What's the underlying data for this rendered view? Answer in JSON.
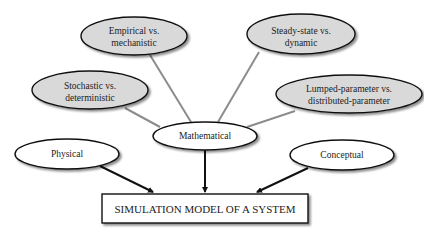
{
  "diagram": {
    "root": {
      "label": "SIMULATION MODEL OF A SYSTEM"
    },
    "primary_types": [
      {
        "id": "physical",
        "label": "Physical"
      },
      {
        "id": "mathematical",
        "label": "Mathematical"
      },
      {
        "id": "conceptual",
        "label": "Conceptual"
      }
    ],
    "mathematical_dimensions": [
      {
        "id": "empirical",
        "line1": "Empirical vs.",
        "line2": "mechanistic"
      },
      {
        "id": "steady",
        "line1": "Steady-state vs.",
        "line2": "dynamic"
      },
      {
        "id": "stochastic",
        "line1": "Stochastic vs.",
        "line2": "deterministic"
      },
      {
        "id": "lumped",
        "line1": "Lumped-parameter vs.",
        "line2": "distributed-parameter"
      }
    ],
    "colors": {
      "dimension_fill": "#d9d9d9",
      "primary_fill": "#ffffff",
      "connector_gray": "#8c8c8c",
      "arrow_black": "#111111"
    }
  }
}
